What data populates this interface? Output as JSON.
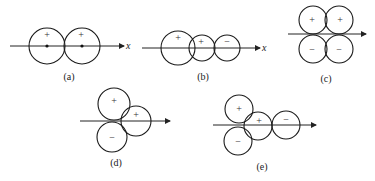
{
  "figure": {
    "axis_label": "x",
    "panels": [
      {
        "id": "a",
        "label": "(a)",
        "signs": [
          "+",
          "+"
        ]
      },
      {
        "id": "b",
        "label": "(b)",
        "signs": [
          "+",
          "+",
          "−"
        ]
      },
      {
        "id": "c",
        "label": "(c)",
        "signs": [
          "+",
          "+",
          "−",
          "−"
        ]
      },
      {
        "id": "d",
        "label": "(d)",
        "signs": [
          "+",
          "+",
          "−"
        ]
      },
      {
        "id": "e",
        "label": "(e)",
        "signs": [
          "+",
          "+",
          "−",
          "−"
        ]
      }
    ]
  }
}
